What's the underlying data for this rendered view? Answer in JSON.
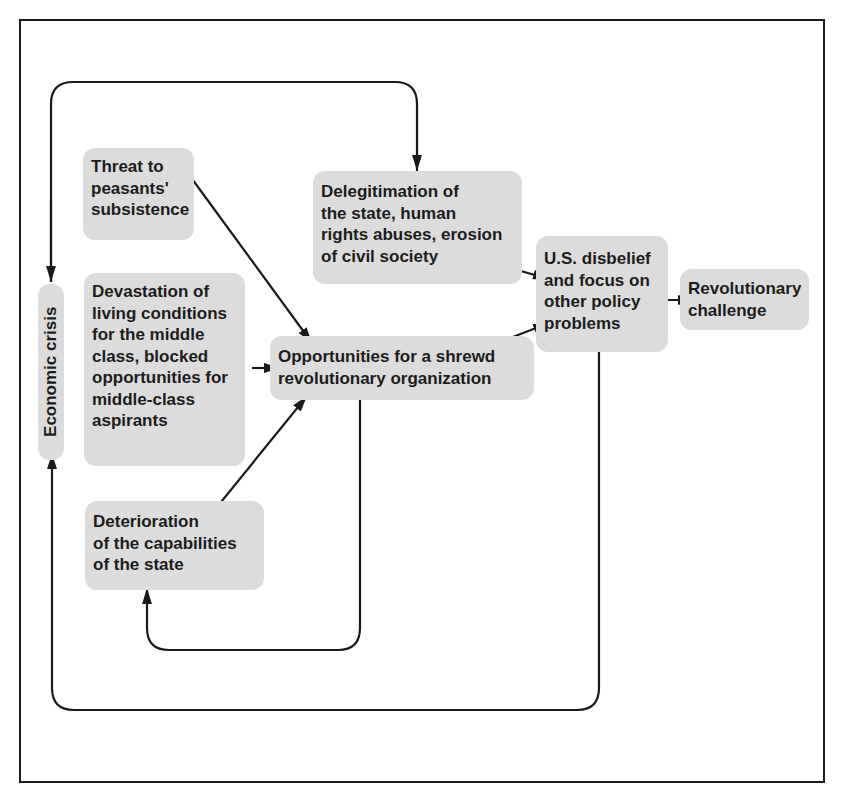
{
  "diagram": {
    "type": "causal-flow",
    "colors": {
      "node_fill": "#dcdcdc",
      "text": "#1c1c1c",
      "line": "#1a1a1a",
      "background": "#ffffff"
    },
    "nodes": {
      "economic_crisis": {
        "label": "Economic crisis"
      },
      "threat": {
        "label": "Threat to\npeasants'\nsubsistence"
      },
      "devastation": {
        "label": "Devastation of\nliving conditions\nfor the middle\nclass, blocked\nopportunities for\nmiddle-class\naspirants"
      },
      "deterioration": {
        "label": "Deterioration\nof the capabilities\nof the state"
      },
      "delegitimation": {
        "label": "Delegitimation of\nthe state, human\nrights abuses, erosion\nof civil society"
      },
      "opportunities": {
        "label": "Opportunities for a shrewd\nrevolutionary organization"
      },
      "us_disbelief": {
        "label": "U.S. disbelief\nand focus on\nother policy\nproblems"
      },
      "revolutionary_challenge": {
        "label": "Revolutionary\nchallenge"
      }
    },
    "edges": [
      {
        "from": "Economic crisis",
        "to": "Delegitimation of the state, human rights abuses, erosion of civil society",
        "style": "loop-over-top"
      },
      {
        "from": "Threat to peasants' subsistence",
        "to": "Opportunities for a shrewd revolutionary organization"
      },
      {
        "from": "Devastation of living conditions for the middle class, blocked opportunities for middle-class aspirants",
        "to": "Opportunities for a shrewd revolutionary organization"
      },
      {
        "from": "Deterioration of the capabilities of the state",
        "to": "Opportunities for a shrewd revolutionary organization"
      },
      {
        "from": "Opportunities for a shrewd revolutionary organization",
        "to": "Deterioration of the capabilities of the state",
        "style": "loop-below"
      },
      {
        "from": "Delegitimation of the state, human rights abuses, erosion of civil society",
        "to": "U.S. disbelief and focus on other policy problems"
      },
      {
        "from": "Opportunities for a shrewd revolutionary organization",
        "to": "U.S. disbelief and focus on other policy problems"
      },
      {
        "from": "U.S. disbelief and focus on other policy problems",
        "to": "Revolutionary challenge"
      },
      {
        "from": "U.S. disbelief and focus on other policy problems",
        "to": "Economic crisis",
        "style": "loop-around-bottom"
      }
    ]
  }
}
